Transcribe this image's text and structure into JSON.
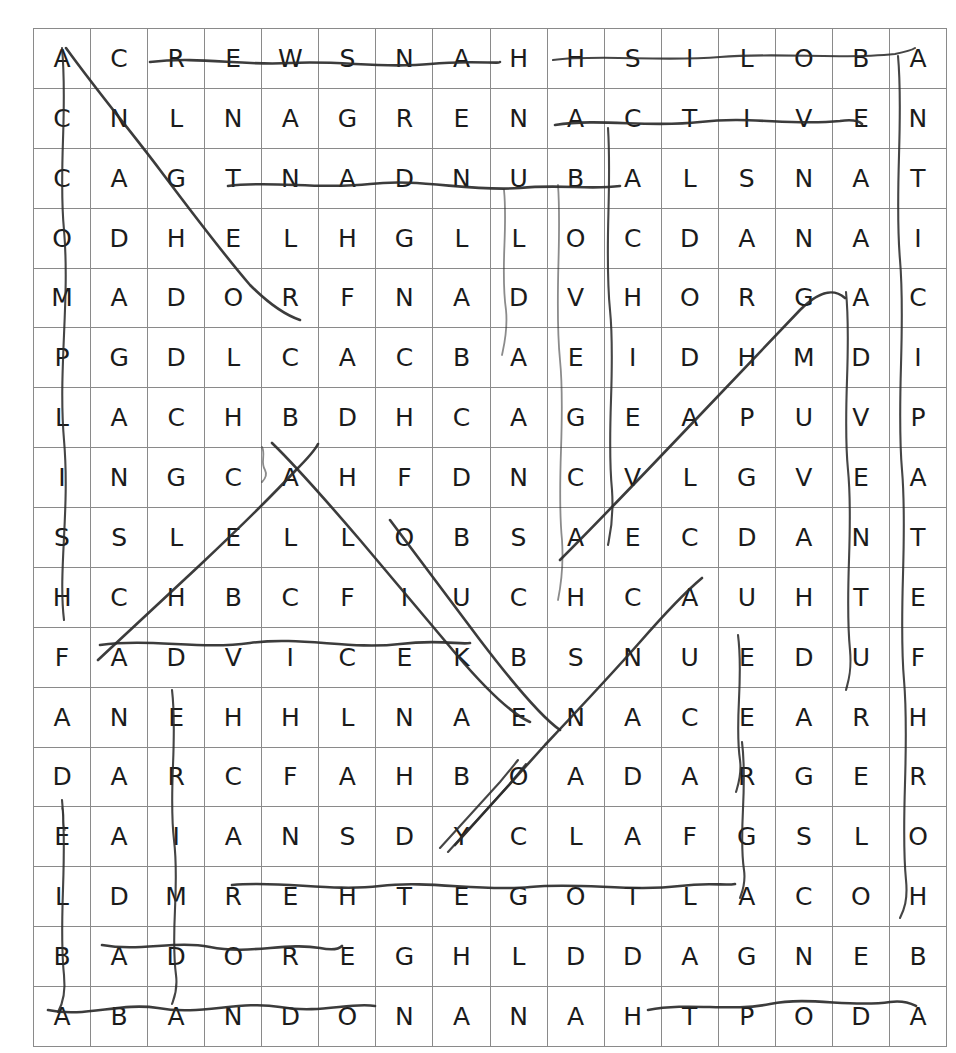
{
  "puzzle": {
    "type": "word-search",
    "rows": 17,
    "columns": 16,
    "grid_color": "#8a8a8a",
    "letter_color": "#1b1b1b",
    "mark_color": "#2b2b2b",
    "background_color": "#ffffff",
    "letters": [
      [
        "A",
        "C",
        "R",
        "E",
        "W",
        "S",
        "N",
        "A",
        "H",
        "H",
        "S",
        "I",
        "L",
        "O",
        "B",
        "A"
      ],
      [
        "C",
        "N",
        "L",
        "N",
        "A",
        "G",
        "R",
        "E",
        "N",
        "A",
        "C",
        "T",
        "I",
        "V",
        "E",
        "N"
      ],
      [
        "C",
        "A",
        "G",
        "T",
        "N",
        "A",
        "D",
        "N",
        "U",
        "B",
        "A",
        "L",
        "S",
        "N",
        "A",
        "T"
      ],
      [
        "O",
        "D",
        "H",
        "E",
        "L",
        "H",
        "G",
        "L",
        "L",
        "O",
        "C",
        "D",
        "A",
        "N",
        "A",
        "I"
      ],
      [
        "M",
        "A",
        "D",
        "O",
        "R",
        "F",
        "N",
        "A",
        "D",
        "V",
        "H",
        "O",
        "R",
        "G",
        "A",
        "C"
      ],
      [
        "P",
        "G",
        "D",
        "L",
        "C",
        "A",
        "C",
        "B",
        "A",
        "E",
        "I",
        "D",
        "H",
        "M",
        "D",
        "I"
      ],
      [
        "L",
        "A",
        "C",
        "H",
        "B",
        "D",
        "H",
        "C",
        "A",
        "G",
        "E",
        "A",
        "P",
        "U",
        "V",
        "P"
      ],
      [
        "I",
        "N",
        "G",
        "C",
        "A",
        "H",
        "F",
        "D",
        "N",
        "C",
        "V",
        "L",
        "G",
        "V",
        "E",
        "A"
      ],
      [
        "S",
        "S",
        "L",
        "E",
        "L",
        "L",
        "O",
        "B",
        "S",
        "A",
        "E",
        "C",
        "D",
        "A",
        "N",
        "T"
      ],
      [
        "H",
        "C",
        "H",
        "B",
        "C",
        "F",
        "I",
        "U",
        "C",
        "H",
        "C",
        "A",
        "U",
        "H",
        "T",
        "E"
      ],
      [
        "F",
        "A",
        "D",
        "V",
        "I",
        "C",
        "E",
        "K",
        "B",
        "S",
        "N",
        "U",
        "E",
        "D",
        "U",
        "F"
      ],
      [
        "A",
        "N",
        "E",
        "H",
        "H",
        "L",
        "N",
        "A",
        "E",
        "N",
        "A",
        "C",
        "E",
        "A",
        "R",
        "H"
      ],
      [
        "D",
        "A",
        "R",
        "C",
        "F",
        "A",
        "H",
        "B",
        "O",
        "A",
        "D",
        "A",
        "R",
        "G",
        "E",
        "R"
      ],
      [
        "E",
        "A",
        "I",
        "A",
        "N",
        "S",
        "D",
        "Y",
        "C",
        "L",
        "A",
        "F",
        "G",
        "S",
        "L",
        "O"
      ],
      [
        "L",
        "D",
        "M",
        "R",
        "E",
        "H",
        "T",
        "E",
        "G",
        "O",
        "T",
        "L",
        "A",
        "C",
        "O",
        "H"
      ],
      [
        "B",
        "A",
        "D",
        "O",
        "R",
        "E",
        "G",
        "H",
        "L",
        "D",
        "D",
        "A",
        "G",
        "N",
        "E",
        "B"
      ],
      [
        "A",
        "B",
        "A",
        "N",
        "D",
        "O",
        "N",
        "A",
        "N",
        "A",
        "H",
        "T",
        "P",
        "O",
        "D",
        "A"
      ]
    ],
    "marks": [
      {
        "name": "mark-row1-across-crews-hanson",
        "weight": "med"
      },
      {
        "name": "mark-col1-down-accomplish",
        "weight": "thin"
      },
      {
        "name": "mark-diagonal-cnghe-down-right",
        "weight": "med"
      },
      {
        "name": "mark-row1-across-hsiloba",
        "weight": "thin"
      },
      {
        "name": "mark-row2-across-active",
        "weight": "med"
      },
      {
        "name": "mark-row3-across-tnadnuba",
        "weight": "med"
      },
      {
        "name": "mark-col11-down-achieve",
        "weight": "thin"
      },
      {
        "name": "mark-col12-down-abandon",
        "weight": "faint"
      },
      {
        "name": "mark-diagonal-up-right-advantage",
        "weight": "med"
      },
      {
        "name": "mark-col16-down-antipathy",
        "weight": "thin"
      },
      {
        "name": "mark-col15-down-advance",
        "weight": "thin"
      },
      {
        "name": "mark-row11-across-advice",
        "weight": "med"
      },
      {
        "name": "mark-diagonal-down-right-belliks",
        "weight": "med"
      },
      {
        "name": "mark-col3-down-adventure",
        "weight": "thin"
      },
      {
        "name": "mark-row15-across-together",
        "weight": "med"
      },
      {
        "name": "mark-row16-across-adore",
        "weight": "med"
      },
      {
        "name": "mark-row17-across-abandon",
        "weight": "med"
      },
      {
        "name": "mark-row17-across-adopt",
        "weight": "med"
      },
      {
        "name": "mark-col13-down-aced",
        "weight": "thin"
      },
      {
        "name": "mark-diagonal-lower-belly",
        "weight": "thin"
      }
    ]
  }
}
